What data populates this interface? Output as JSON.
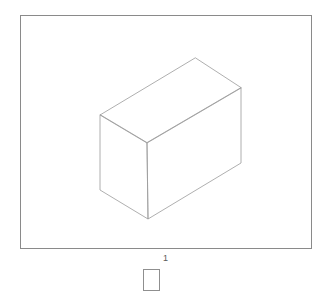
{
  "document": {
    "background_color": "#ffffff",
    "page_label": "1"
  },
  "frame": {
    "name": "drawing-border",
    "x": 20,
    "y": 15,
    "width": 292,
    "height": 234,
    "stroke_color": "#8a8a8a",
    "stroke_width": 1,
    "fill": "none"
  },
  "shape": {
    "name": "isometric-cuboid",
    "description": "Wireframe rectangular box drawn in isometric projection",
    "stroke_color": "#9b9b9b",
    "stroke_width": 0.8,
    "fill": "none",
    "vertices": {
      "top_back": [
        195,
        58
      ],
      "top_left": [
        100,
        115
      ],
      "top_front": [
        147,
        143
      ],
      "top_right": [
        241,
        88
      ],
      "bottom_left": [
        100,
        190
      ],
      "bottom_front": [
        148,
        219
      ],
      "bottom_right": [
        241,
        163
      ]
    },
    "edges": [
      [
        "top_back",
        "top_left"
      ],
      [
        "top_left",
        "top_front"
      ],
      [
        "top_front",
        "top_right"
      ],
      [
        "top_right",
        "top_back"
      ],
      [
        "top_left",
        "bottom_left"
      ],
      [
        "top_front",
        "bottom_front"
      ],
      [
        "top_right",
        "bottom_right"
      ],
      [
        "bottom_left",
        "bottom_front"
      ],
      [
        "bottom_front",
        "bottom_right"
      ]
    ]
  },
  "thumbnail": {
    "name": "page-thumbnail",
    "x": 143,
    "y": 269,
    "width": 17,
    "height": 22,
    "stroke_color": "#8f8f8f",
    "fill": "#ffffff"
  }
}
